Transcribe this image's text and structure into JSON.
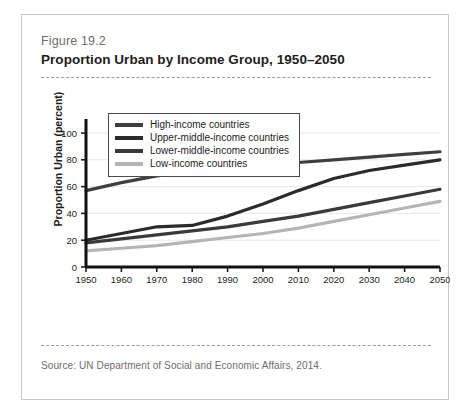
{
  "figure": {
    "number": "Figure 19.2",
    "title": "Proportion Urban by Income Group, 1950–2050",
    "source": "Source: UN Department of Social and Economic Affairs, 2014."
  },
  "chart_data": {
    "type": "line",
    "title": "Proportion Urban by Income Group, 1950–2050",
    "xlabel": "",
    "ylabel": "Proportion Urban (percent)",
    "xlim": [
      1950,
      2050
    ],
    "ylim": [
      0,
      100
    ],
    "xticks": [
      "1950",
      "1960",
      "1970",
      "1980",
      "1990",
      "2000",
      "2010",
      "2020",
      "2030",
      "2040",
      "2050"
    ],
    "yticks": [
      "0",
      "20",
      "40",
      "60",
      "80",
      "100"
    ],
    "grid": "horizontal",
    "legend_position": "upper-left-inside",
    "x": [
      1950,
      1960,
      1970,
      1980,
      1990,
      2000,
      2010,
      2020,
      2030,
      2040,
      2050
    ],
    "series": [
      {
        "name": "High-income countries",
        "color": "#3f3f3f",
        "values": [
          57,
          63,
          68,
          71,
          73,
          75,
          78,
          80,
          82,
          84,
          86
        ]
      },
      {
        "name": "Upper-middle-income countries",
        "color": "#2b2b2b",
        "values": [
          20,
          25,
          30,
          31,
          38,
          47,
          57,
          66,
          72,
          76,
          80
        ]
      },
      {
        "name": "Lower-middle-income countries",
        "color": "#3a3a3a",
        "values": [
          18,
          21,
          24,
          27,
          30,
          34,
          38,
          43,
          48,
          53,
          58
        ]
      },
      {
        "name": "Low-income countries",
        "color": "#b5b5b5",
        "values": [
          12,
          14,
          16,
          19,
          22,
          25,
          29,
          34,
          39,
          44,
          49
        ]
      }
    ]
  }
}
